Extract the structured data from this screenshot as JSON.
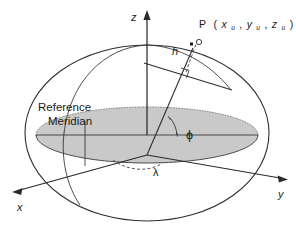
{
  "figure": {
    "background_color": "#ffffff",
    "line_color": "#2e2e2e",
    "plane_fill_color": "#c9c9c9"
  },
  "axes": {
    "z": {
      "label": "z",
      "direction": "up"
    },
    "y": {
      "label": "y",
      "direction": "right"
    },
    "x": {
      "label": "x",
      "direction": "lower-left"
    }
  },
  "labels": {
    "reference_meridian_line1": "Reference",
    "reference_meridian_line2": "Meridian",
    "height": "h",
    "latitude": "ϕ",
    "longitude": "λ",
    "point_name": "P",
    "point_open_paren": "(",
    "point_close_paren": ")",
    "coord_x": "x",
    "coord_y": "y",
    "coord_z": "z",
    "coord_subscript": "u",
    "comma": ",",
    "point_full": "P (xu,yu,zu)"
  },
  "elements": {
    "ellipsoid_outline": "outer ellipsoid silhouette",
    "equatorial_plane": "shaded equatorial plane ellipse",
    "reference_meridian_arc": "meridian great-circle arc through prime meridian",
    "tangent_line": "tangent plane line at surface point",
    "normal_line": "ellipsoidal normal through point P",
    "right_angle_marker": "right angle between normal and tangent",
    "point_marker": "point P marker above surface",
    "latitude_arc": "arc showing geodetic latitude phi",
    "longitude_arc": "dashed arc showing geodetic longitude lambda"
  }
}
